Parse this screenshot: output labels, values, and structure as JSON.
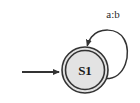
{
  "diagram": {
    "type": "finite-state-automaton",
    "title": "",
    "background_color": "#ffffff",
    "width": 140,
    "height": 103,
    "stroke_color": "#333333",
    "states": [
      {
        "id": "S1",
        "label": "S1",
        "accepting": true,
        "initial": true,
        "fill_color": "#e3e3e3",
        "outline_color": "#333333",
        "cx": 85,
        "cy": 70,
        "outer_radius": 23,
        "inner_radius": 19.5
      }
    ],
    "start_arrow": {
      "name": "start-arrow",
      "from_x": 22,
      "to_x": 62,
      "y": 72,
      "color": "#333333"
    },
    "transitions": [
      {
        "name": "self-loop-s1",
        "from": "S1",
        "to": "S1",
        "label": "a:b",
        "label_x": 113,
        "label_y": 14,
        "color": "#333333",
        "arrowhead": "down-into-top"
      }
    ]
  }
}
